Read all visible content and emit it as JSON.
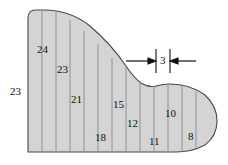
{
  "figure": {
    "kind": "area-approximation-cross-section",
    "fill_color": "#d4d4d4",
    "outline_color": "#4a4a4a",
    "gridline_color": "#8a8a8a",
    "label_color": "#111111",
    "background_color": "#ffffff",
    "geometry": {
      "left_edge_x": 28,
      "baseline_y": 152,
      "top_y": 10,
      "right_tip_x": 217,
      "strip_spacing_px": 14,
      "outline_path": "M 28,152 L 28,18 Q 28,10 36,10 L 44,10 Q 70,10 90,26 Q 112,45 126,66 Q 134,78 141,83 Q 149,88 156,86 Q 163,84 170,84 Q 190,84 205,95 Q 217,106 217,121 Q 217,136 205,145 Q 192,152 176,152 Z"
    },
    "left_dimension": {
      "value": "23",
      "x": 10,
      "y": 86
    },
    "ordinates": [
      {
        "value": "24",
        "line_x": 42,
        "label_x": 37,
        "label_y": 44,
        "line_top": 10,
        "line_bottom": 152
      },
      {
        "value": "23",
        "line_x": 56,
        "label_x": 57,
        "label_y": 64,
        "line_top": 12,
        "line_bottom": 152
      },
      {
        "value": "21",
        "line_x": 70,
        "label_x": 71,
        "label_y": 94,
        "line_top": 20,
        "line_bottom": 152
      },
      {
        "value": "18",
        "line_x": 84,
        "label_x": 95,
        "label_y": 132,
        "line_top": 31,
        "line_bottom": 152
      },
      {
        "value": "15",
        "line_x": 98,
        "label_x": 113,
        "label_y": 99,
        "line_top": 44,
        "line_bottom": 152
      },
      {
        "value": "12",
        "line_x": 112,
        "label_x": 127,
        "label_y": 118,
        "line_top": 58,
        "line_bottom": 152
      },
      {
        "value": "11",
        "line_x": 126,
        "label_x": 149,
        "label_y": 136,
        "line_top": 67,
        "line_bottom": 152
      },
      {
        "value": "10",
        "line_x": 140,
        "label_x": 165,
        "label_y": 108,
        "line_top": 82,
        "line_bottom": 152
      },
      {
        "value": "8",
        "line_x": 154,
        "label_x": 188,
        "label_y": 131,
        "line_top": 86,
        "line_bottom": 152
      }
    ],
    "extra_gridlines": [
      {
        "line_x": 168,
        "line_top": 84,
        "line_bottom": 152
      },
      {
        "line_x": 182,
        "line_top": 85,
        "line_bottom": 152
      },
      {
        "line_x": 196,
        "line_top": 91,
        "line_bottom": 150
      }
    ],
    "spacing_dimension": {
      "value": "3",
      "label_x": 163,
      "label_y": 56,
      "left_arrow": {
        "x1": 126,
        "y1": 61,
        "x2": 153,
        "y2": 61
      },
      "right_arrow": {
        "x1": 196,
        "y1": 61,
        "x2": 170,
        "y2": 61
      },
      "left_tick": {
        "x": 156,
        "y1": 49,
        "y2": 73
      },
      "right_tick": {
        "x": 170,
        "y1": 49,
        "y2": 73
      }
    }
  }
}
